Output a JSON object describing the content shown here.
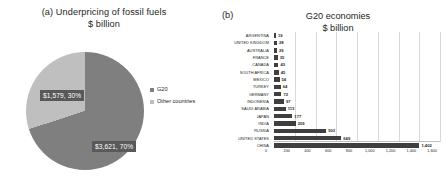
{
  "panel_a": {
    "marker": "(a)",
    "title_line1": "Underpricing of fossil fuels",
    "title_line2": "$ billion",
    "legend": [
      {
        "label": "G20",
        "color": "#7f7f7f"
      },
      {
        "label": "Other countries",
        "color": "#bfbfbf"
      }
    ],
    "labels": {
      "g20": "$3,621, 70%",
      "other": "$1,579, 30%"
    }
  },
  "panel_b": {
    "marker": "(b)",
    "title_line1": "G20 economies",
    "title_line2": "$ billion"
  },
  "chart_data": [
    {
      "type": "pie",
      "title": "Underpricing of fossil fuels",
      "subtitle": "$ billion",
      "labels": [
        "G20",
        "Other countries"
      ],
      "values": [
        3621,
        1579
      ],
      "percents": [
        70,
        30
      ],
      "data_labels": [
        "$3,621, 70%",
        "$1,579, 30%"
      ],
      "colors": [
        "#7f7f7f",
        "#bfbfbf"
      ],
      "legend_position": "right",
      "grid": false
    },
    {
      "type": "bar",
      "orientation": "horizontal",
      "title": "G20 economies",
      "subtitle": "$ billion",
      "xlabel": "",
      "ylabel": "",
      "xlim": [
        0,
        1600
      ],
      "xticks": [
        0,
        200,
        400,
        600,
        800,
        1000,
        1200,
        1400,
        1600
      ],
      "xtick_labels": [
        "0",
        "200",
        "400",
        "600",
        "800",
        "1,000",
        "1,200",
        "1,400",
        "1,600"
      ],
      "grid": true,
      "bar_color": "#3f3f3f",
      "categories": [
        "ARGENTINA",
        "UNITED KINGDOM",
        "AUSTRALIA",
        "FRANCE",
        "CANADA",
        "SOUTH AFRICA",
        "MEXICO",
        "TURKEY",
        "GERMANY",
        "INDONESIA",
        "SAUDI ARABIA",
        "JAPAN",
        "INDIA",
        "RUSSIA",
        "UNITED STATES",
        "CHINA"
      ],
      "values": [
        19,
        28,
        29,
        35,
        43,
        45,
        54,
        64,
        72,
        97,
        113,
        177,
        209,
        503,
        649,
        1402
      ],
      "data_labels": [
        "19",
        "28",
        "29",
        "35",
        "43",
        "45",
        "54",
        "64",
        "72",
        "97",
        "113",
        "177",
        "209",
        "503",
        "649",
        "1,402"
      ]
    }
  ]
}
